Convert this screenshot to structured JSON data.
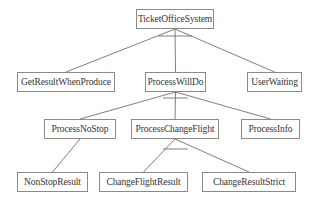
{
  "diagram": {
    "type": "hierarchy-tree",
    "nodes": [
      {
        "id": "root",
        "label": "TicketOfficeSystem",
        "x": 136,
        "y": 9,
        "w": 78,
        "h": 20
      },
      {
        "id": "getresult",
        "label": "GetResultWhenProduce",
        "x": 17,
        "y": 72,
        "w": 98,
        "h": 20
      },
      {
        "id": "processwilldo",
        "label": "ProcessWillDo",
        "x": 145,
        "y": 72,
        "w": 61,
        "h": 20
      },
      {
        "id": "userwaiting",
        "label": "UserWaiting",
        "x": 247,
        "y": 72,
        "w": 55,
        "h": 20
      },
      {
        "id": "processnostop",
        "label": "ProcessNoStop",
        "x": 44,
        "y": 119,
        "w": 72,
        "h": 20
      },
      {
        "id": "processchangeflight",
        "label": "ProcessChangeFlight",
        "x": 131,
        "y": 119,
        "w": 88,
        "h": 20
      },
      {
        "id": "processinfo",
        "label": "ProcessInfo",
        "x": 241,
        "y": 119,
        "w": 59,
        "h": 20
      },
      {
        "id": "nonstopresult",
        "label": "NonStopResult",
        "x": 17,
        "y": 172,
        "w": 71,
        "h": 20
      },
      {
        "id": "changeflightresult",
        "label": "ChangeFlightResult",
        "x": 99,
        "y": 172,
        "w": 89,
        "h": 20
      },
      {
        "id": "changeresultstrict",
        "label": "ChangeResultStrict",
        "x": 202,
        "y": 172,
        "w": 94,
        "h": 20
      }
    ],
    "edges": [
      {
        "from": "root",
        "to": "getresult"
      },
      {
        "from": "root",
        "to": "processwilldo"
      },
      {
        "from": "root",
        "to": "userwaiting"
      },
      {
        "from": "processwilldo",
        "to": "processnostop"
      },
      {
        "from": "processwilldo",
        "to": "processchangeflight"
      },
      {
        "from": "processwilldo",
        "to": "processinfo"
      },
      {
        "from": "processnostop",
        "to": "nonstopresult"
      },
      {
        "from": "processchangeflight",
        "to": "changeflightresult"
      },
      {
        "from": "processchangeflight",
        "to": "changeresultstrict"
      }
    ],
    "arcs": [
      {
        "parent": "root",
        "x1": 158,
        "x2": 192,
        "y": 36
      },
      {
        "parent": "processwilldo",
        "x1": 163,
        "x2": 188,
        "y": 98
      },
      {
        "parent": "processchangeflight",
        "x1": 163,
        "x2": 188,
        "y": 149
      }
    ],
    "colors": {
      "border": "#8a8a8a",
      "line": "#6f6f6f",
      "text": "#333333",
      "background": "#ffffff"
    }
  }
}
